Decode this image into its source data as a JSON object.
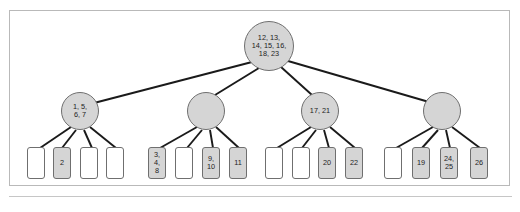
{
  "figure": {
    "background_color": "#ffffff",
    "frame_color": "#b9b9b9",
    "node_fill": "#d5d5d5",
    "node_stroke": "#6f6f6f",
    "empty_leaf_fill": "#ffffff",
    "filled_leaf_fill": "#d5d5d5",
    "edge_color": "#1a1a1a"
  },
  "tree": {
    "root": {
      "label": "12, 13,\n14, 15, 16,\n18, 23",
      "keys": [
        12,
        13,
        14,
        15,
        16,
        18,
        23
      ],
      "cx": 269,
      "cy": 46,
      "r": 25
    },
    "internal": [
      {
        "label": "1, 5,\n6, 7",
        "keys": [
          1,
          5,
          6,
          7
        ],
        "cx": 80,
        "cy": 111,
        "r": 19
      },
      {
        "label": "",
        "keys": [],
        "cx": 206,
        "cy": 111,
        "r": 19
      },
      {
        "label": "17, 21",
        "keys": [
          17,
          21
        ],
        "cx": 320,
        "cy": 111,
        "r": 19
      },
      {
        "label": "",
        "keys": [],
        "cx": 442,
        "cy": 111,
        "r": 19
      }
    ],
    "leaves": [
      {
        "label": "",
        "filled": false,
        "x": 27,
        "y": 147,
        "w": 18,
        "h": 32
      },
      {
        "label": "2",
        "filled": true,
        "x": 53,
        "y": 147,
        "w": 18,
        "h": 32
      },
      {
        "label": "",
        "filled": false,
        "x": 80,
        "y": 147,
        "w": 18,
        "h": 32
      },
      {
        "label": "",
        "filled": false,
        "x": 106,
        "y": 147,
        "w": 18,
        "h": 32
      },
      {
        "label": "3,\n4,\n8",
        "filled": true,
        "x": 148,
        "y": 147,
        "w": 18,
        "h": 32
      },
      {
        "label": "",
        "filled": false,
        "x": 175,
        "y": 147,
        "w": 18,
        "h": 32
      },
      {
        "label": "9,\n10",
        "filled": true,
        "x": 202,
        "y": 147,
        "w": 18,
        "h": 32
      },
      {
        "label": "11",
        "filled": true,
        "x": 229,
        "y": 147,
        "w": 18,
        "h": 32
      },
      {
        "label": "",
        "filled": false,
        "x": 265,
        "y": 147,
        "w": 18,
        "h": 32
      },
      {
        "label": "",
        "filled": false,
        "x": 292,
        "y": 147,
        "w": 18,
        "h": 32
      },
      {
        "label": "20",
        "filled": true,
        "x": 318,
        "y": 147,
        "w": 18,
        "h": 32
      },
      {
        "label": "22",
        "filled": true,
        "x": 345,
        "y": 147,
        "w": 18,
        "h": 32
      },
      {
        "label": "",
        "filled": false,
        "x": 384,
        "y": 147,
        "w": 18,
        "h": 32
      },
      {
        "label": "19",
        "filled": true,
        "x": 412,
        "y": 147,
        "w": 18,
        "h": 32
      },
      {
        "label": "24,\n25",
        "filled": true,
        "x": 440,
        "y": 147,
        "w": 18,
        "h": 32
      },
      {
        "label": "26",
        "filled": true,
        "x": 470,
        "y": 147,
        "w": 18,
        "h": 32
      }
    ],
    "edges": [
      {
        "from": "root",
        "to": "internal-0",
        "x1": 252,
        "y1": 62,
        "x2": 94,
        "y2": 103
      },
      {
        "from": "root",
        "to": "internal-1",
        "x1": 259,
        "y1": 68,
        "x2": 215,
        "y2": 95
      },
      {
        "from": "root",
        "to": "internal-2",
        "x1": 281,
        "y1": 67,
        "x2": 312,
        "y2": 95
      },
      {
        "from": "root",
        "to": "internal-3",
        "x1": 288,
        "y1": 61,
        "x2": 429,
        "y2": 102
      },
      {
        "from": "internal-0",
        "to": "leaf-0",
        "x1": 71,
        "y1": 127,
        "x2": 40,
        "y2": 148
      },
      {
        "from": "internal-0",
        "to": "leaf-1",
        "x1": 76,
        "y1": 130,
        "x2": 62,
        "y2": 148
      },
      {
        "from": "internal-0",
        "to": "leaf-2",
        "x1": 84,
        "y1": 130,
        "x2": 92,
        "y2": 148
      },
      {
        "from": "internal-0",
        "to": "leaf-3",
        "x1": 90,
        "y1": 127,
        "x2": 116,
        "y2": 148
      },
      {
        "from": "internal-1",
        "to": "leaf-4",
        "x1": 197,
        "y1": 127,
        "x2": 160,
        "y2": 148
      },
      {
        "from": "internal-1",
        "to": "leaf-5",
        "x1": 202,
        "y1": 130,
        "x2": 187,
        "y2": 148
      },
      {
        "from": "internal-1",
        "to": "leaf-6",
        "x1": 210,
        "y1": 130,
        "x2": 213,
        "y2": 148
      },
      {
        "from": "internal-1",
        "to": "leaf-7",
        "x1": 216,
        "y1": 127,
        "x2": 239,
        "y2": 148
      },
      {
        "from": "internal-2",
        "to": "leaf-8",
        "x1": 311,
        "y1": 127,
        "x2": 277,
        "y2": 148
      },
      {
        "from": "internal-2",
        "to": "leaf-9",
        "x1": 316,
        "y1": 130,
        "x2": 302,
        "y2": 148
      },
      {
        "from": "internal-2",
        "to": "leaf-10",
        "x1": 324,
        "y1": 130,
        "x2": 329,
        "y2": 148
      },
      {
        "from": "internal-2",
        "to": "leaf-11",
        "x1": 330,
        "y1": 127,
        "x2": 355,
        "y2": 148
      },
      {
        "from": "internal-3",
        "to": "leaf-12",
        "x1": 433,
        "y1": 127,
        "x2": 396,
        "y2": 148
      },
      {
        "from": "internal-3",
        "to": "leaf-13",
        "x1": 438,
        "y1": 130,
        "x2": 422,
        "y2": 148
      },
      {
        "from": "internal-3",
        "to": "leaf-14",
        "x1": 446,
        "y1": 130,
        "x2": 450,
        "y2": 148
      },
      {
        "from": "internal-3",
        "to": "leaf-15",
        "x1": 452,
        "y1": 127,
        "x2": 480,
        "y2": 148
      }
    ]
  }
}
